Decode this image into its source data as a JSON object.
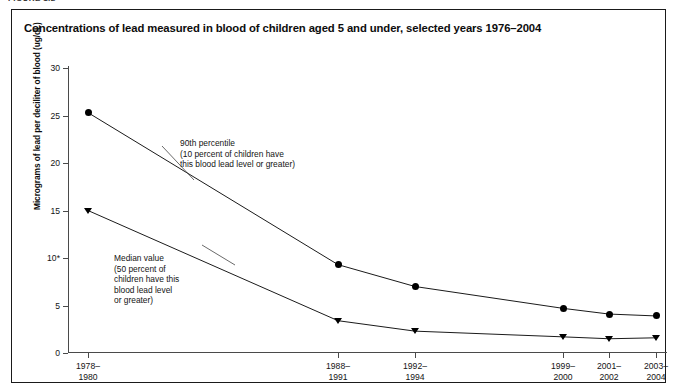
{
  "figure_tag": "FIGURE 1.2",
  "chart_title": "Concentrations of lead measured in blood of children aged 5 and under, selected years 1976–2004",
  "y_axis_title": "Micrograms of lead per deciliter of blood (ug/dL)",
  "annotations": {
    "p90": "90th percentile\n(10 percent of children have\nthis blood lead level or greater)",
    "median": "Median value\n(50 percent of\nchildren have this\nblood lead level\nor greater)"
  },
  "colors": {
    "line": "#000000",
    "axis": "#4a4a4a",
    "border": "#1a1a1a",
    "background": "#ffffff"
  },
  "chart_data": {
    "type": "line",
    "title": "Concentrations of lead measured in blood of children aged 5 and under, selected years 1976–2004",
    "xlabel": "",
    "ylabel": "Micrograms of lead per deciliter of blood (ug/dL)",
    "ylim": [
      0,
      30
    ],
    "yticks": [
      0,
      5,
      10,
      15,
      20,
      25,
      30
    ],
    "ytick_labels": [
      "0",
      "5",
      "10*",
      "15",
      "20",
      "25",
      "30"
    ],
    "grid": false,
    "legend": "annotations",
    "categories": [
      "1978–1980",
      "1988–1991",
      "1992–1994",
      "1999–2000",
      "2001–2002",
      "2003–2004"
    ],
    "category_lines": [
      [
        "1978–",
        "1980"
      ],
      [
        "1988–",
        "1991"
      ],
      [
        "1992–",
        "1994"
      ],
      [
        "1999–",
        "2000"
      ],
      [
        "2001–",
        "2002"
      ],
      [
        "2003–",
        "2004"
      ]
    ],
    "x_positions_px": [
      87,
      337,
      414,
      562,
      608,
      655
    ],
    "series": [
      {
        "name": "90th percentile",
        "marker": "circle",
        "values": [
          25.3,
          9.3,
          7.0,
          4.7,
          4.1,
          3.9
        ]
      },
      {
        "name": "Median value",
        "marker": "triangle",
        "values": [
          15.0,
          3.4,
          2.3,
          1.7,
          1.5,
          1.6
        ]
      }
    ]
  }
}
